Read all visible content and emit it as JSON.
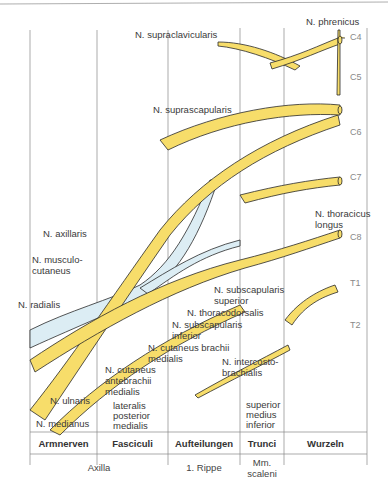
{
  "colors": {
    "nerve": "#f7dd6a",
    "posterior": "#dcedf4",
    "outline": "#2a2a2a",
    "grid": "#888888"
  },
  "labels": {
    "phrenicus": "N. phrenicus",
    "supraclavicularis": "N. supraclavicularis",
    "suprascapularis": "N. suprascapularis",
    "thoracicus1": "N. thoracicus",
    "thoracicus2": "longus",
    "axillaris": "N. axillaris",
    "musculo1": "N. musculo-",
    "musculo2": "cutaneus",
    "radialis": "N. radialis",
    "subscap_sup1": "N. subscapularis",
    "subscap_sup2": "superior",
    "thoracodorsalis": "N. thoracodorsalis",
    "subscap_inf1": "N. subscapularis",
    "subscap_inf2": "inferior",
    "cut_brachii1": "N. cutaneus brachii",
    "cut_brachii2": "medialis",
    "cut_antebrachii1": "N. cutaneus",
    "cut_antebrachii2": "antebrachii",
    "cut_antebrachii3": "medialis",
    "intercosto1": "N. intercosto-",
    "intercosto2": "brachialis",
    "ulnaris": "N. ulnaris",
    "medianus": "N. medianus",
    "fasciculi1": "lateralis",
    "fasciculi2": "posterior",
    "fasciculi3": "medialis",
    "trunci1": "superior",
    "trunci2": "medius",
    "trunci3": "inferior"
  },
  "segments": [
    "C4",
    "C5",
    "C6",
    "C7",
    "C8",
    "T1",
    "T2"
  ],
  "table": {
    "headers": [
      "Armnerven",
      "Fasciculi",
      "Aufteilungen",
      "Trunci",
      "Wurzeln"
    ],
    "footer": {
      "axilla": "Axilla",
      "rippe": "1. Rippe",
      "scaleni1": "Mm.",
      "scaleni2": "scaleni"
    }
  }
}
